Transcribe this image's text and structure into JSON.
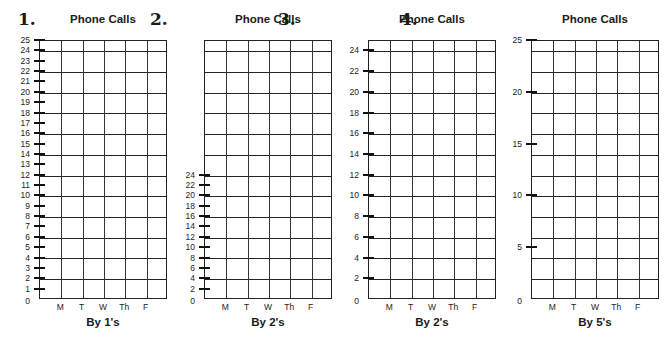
{
  "chart_data": [
    {
      "type": "table",
      "number": "1.",
      "title": "Phone Calls",
      "subtitle": "By 1's",
      "categories": [
        "M",
        "T",
        "W",
        "Th",
        "F"
      ],
      "ylim": [
        0,
        25
      ],
      "y_ticks": [
        1,
        2,
        3,
        4,
        5,
        6,
        7,
        8,
        9,
        10,
        11,
        12,
        13,
        14,
        15,
        16,
        17,
        18,
        19,
        20,
        21,
        22,
        23,
        24,
        25
      ],
      "y_labels": [
        "0",
        "1",
        "2",
        "3",
        "4",
        "5",
        "6",
        "7",
        "8",
        "9",
        "10",
        "11",
        "12",
        "13",
        "14",
        "15",
        "16",
        "17",
        "18",
        "19",
        "20",
        "21",
        "22",
        "23",
        "24",
        "25"
      ],
      "grid": true,
      "values": []
    },
    {
      "type": "table",
      "number": "2.",
      "title": "Phone Calls",
      "subtitle": "By 2's",
      "categories": [
        "M",
        "T",
        "W",
        "Th",
        "F"
      ],
      "ylim": [
        0,
        24
      ],
      "y_ticks": [
        2,
        4,
        6,
        8,
        10,
        12,
        14,
        16,
        18,
        20,
        22,
        24
      ],
      "y_labels": [
        "0",
        "2",
        "4",
        "6",
        "8",
        "10",
        "12",
        "14",
        "16",
        "18",
        "20",
        "22",
        "24"
      ],
      "grid": true,
      "values": []
    },
    {
      "type": "table",
      "number": "3.",
      "title": "Phone Calls",
      "subtitle": "By 2's",
      "categories": [
        "M",
        "T",
        "W",
        "Th",
        "F"
      ],
      "ylim": [
        0,
        24
      ],
      "y_ticks": [
        2,
        4,
        6,
        8,
        10,
        12,
        14,
        16,
        18,
        20,
        22,
        24
      ],
      "y_labels": [
        "0",
        "2",
        "4",
        "6",
        "8",
        "10",
        "12",
        "14",
        "16",
        "18",
        "20",
        "22",
        "24"
      ],
      "grid": true,
      "values": []
    },
    {
      "type": "table",
      "number": "4.",
      "title": "Phone Calls",
      "subtitle": "By 5's",
      "categories": [
        "M",
        "T",
        "W",
        "Th",
        "F"
      ],
      "ylim": [
        0,
        25
      ],
      "y_ticks": [
        5,
        10,
        15,
        20,
        25
      ],
      "y_labels": [
        "0",
        "5",
        "10",
        "15",
        "20",
        "25"
      ],
      "grid": true,
      "values": []
    }
  ],
  "panels": [
    {
      "number": "1.",
      "title": "Phone Calls",
      "subtitle": "By 1's"
    },
    {
      "number": "2.",
      "title": "Phone Calls",
      "subtitle": "By 2's"
    },
    {
      "number": "3.",
      "title": "Phone Calls",
      "subtitle": "By 2's"
    },
    {
      "number": "4.",
      "title": "Phone Calls",
      "subtitle": "By 5's"
    }
  ],
  "days": [
    "M",
    "T",
    "W",
    "Th",
    "F"
  ]
}
